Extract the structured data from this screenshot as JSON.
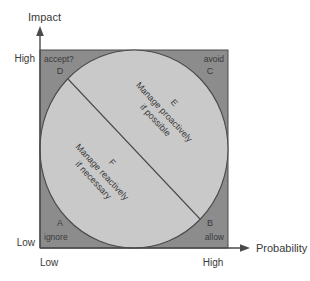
{
  "diagram": {
    "title_visible": false,
    "axes": {
      "y": {
        "name": "Impact",
        "high_label": "High",
        "low_label": "Low"
      },
      "x": {
        "name": "Probability",
        "high_label": "High",
        "low_label": "Low"
      }
    },
    "corners": {
      "top_left": {
        "letter": "D",
        "label": "accept?"
      },
      "top_right": {
        "letter": "C",
        "label": "avoid"
      },
      "bottom_left": {
        "letter": "A",
        "label": "ignore"
      },
      "bottom_right": {
        "letter": "B",
        "label": "allow"
      }
    },
    "zones": [
      {
        "letter": "E",
        "line1": "Manage proactively",
        "line2": "if possible"
      },
      {
        "letter": "F",
        "line1": "Manage reactively",
        "line2": "if necessary"
      }
    ],
    "colors": {
      "outer_square": "#8c8c8c",
      "circle_fill": "#c9c9c9",
      "stroke": "#4a4a4a",
      "text": "#3a3a3a",
      "background": "#ffffff"
    }
  }
}
